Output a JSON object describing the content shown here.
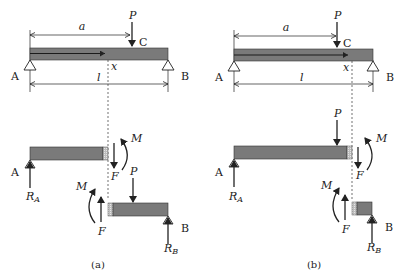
{
  "colors": {
    "beam": "#7a7a7a",
    "beam_dark": "#555555",
    "hatch": "#c8c8c8",
    "line": "#222222"
  },
  "labels": {
    "a": "a",
    "P": "P",
    "C": "C",
    "x": "x",
    "l": "l",
    "A": "A",
    "B": "B",
    "M": "M",
    "F": "F",
    "R": "R",
    "RA_sub": "A",
    "RB_sub": "B"
  },
  "panels": [
    {
      "caption": "(a)",
      "cut_position": "left of C (x < a)"
    },
    {
      "caption": "(b)",
      "cut_position": "right of C (x > a)"
    }
  ]
}
